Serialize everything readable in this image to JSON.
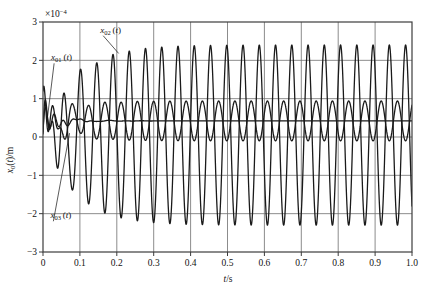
{
  "chart_data": {
    "type": "line",
    "title": "",
    "xlabel": "t/s",
    "ylabel": "x₀(t)/m",
    "y_multiplier": "×10⁻⁴",
    "y_multiplier_value": 0.0001,
    "xlim": [
      0,
      1.0
    ],
    "ylim": [
      -3,
      3
    ],
    "xticks": [
      "0",
      "0.1",
      "0.2",
      "0.3",
      "0.4",
      "0.5",
      "0.6",
      "0.7",
      "0.8",
      "0.9",
      "1.0"
    ],
    "xtick_values": [
      0,
      0.1,
      0.2,
      0.3,
      0.4,
      0.5,
      0.6,
      0.7,
      0.8,
      0.9,
      1.0
    ],
    "yticks": [
      "3",
      "2",
      "1",
      "0",
      "-1",
      "-2",
      "-3"
    ],
    "ytick_values": [
      3,
      2,
      1,
      0,
      -1,
      -2,
      -3
    ],
    "grid": true,
    "grid_x": true,
    "grid_y": true,
    "legend_position": "inline-annotations",
    "series": [
      {
        "name": "x01",
        "label": "x₀₁(t)",
        "label_base": "x",
        "label_sub": "01",
        "label_arg": "(t)",
        "color": "#1a1a1a",
        "line_width": 1.3,
        "description": "Heavily damped response settling to a steady offset of about 0.42e-4 m; early transient peaks near 0.85e-4 m and dips near -0.15e-4 m before flattening after ~0.15 s.",
        "steady_value": 0.42,
        "transient_peak": 0.85,
        "settle_time": 0.15
      },
      {
        "name": "x02",
        "label": "x₀₂(t)",
        "label_base": "x",
        "label_sub": "02",
        "label_arg": "(t)",
        "color": "#1a1a1a",
        "line_width": 1.3,
        "description": "Large-amplitude steady oscillation about a small positive mean; amplitude grows from the start and saturates near ±2.35e-4 m by t ≈ 0.25 s. Frequency about 22.7 Hz (period ≈ 0.044 s).",
        "steady_amplitude": 2.35,
        "mean_offset": 0.05,
        "frequency_hz": 22.7,
        "period_s": 0.044,
        "buildup_time": 0.25,
        "peak_max": 2.38,
        "peak_min": -2.45
      },
      {
        "name": "x03",
        "label": "x₀₃(t)",
        "label_base": "x",
        "label_sub": "03",
        "label_arg": "(t)",
        "color": "#1a1a1a",
        "line_width": 1.3,
        "description": "Medium-amplitude oscillation riding on the steady offset; settles to roughly ±0.52e-4 m about a mean of 0.42e-4 m. Same driving frequency region as x02 with an early transient to about 1.5e-4 m near t = 0.07 s.",
        "steady_amplitude": 0.52,
        "mean_offset": 0.42,
        "frequency_hz": 22.7,
        "transient_peak": 1.5,
        "transient_min": -1.2
      }
    ],
    "annotations": [
      {
        "name": "x02-annotation",
        "text": "x₀₂(t)",
        "label_base": "x",
        "label_sub": "02",
        "label_arg": "(t)",
        "text_x": 0.155,
        "text_y": 2.72,
        "target_x": 0.205,
        "target_y": 2.18
      },
      {
        "name": "x01-annotation",
        "text": "x₀₁(t)",
        "label_base": "x",
        "label_sub": "01",
        "label_arg": "(t)",
        "text_x": 0.022,
        "text_y": 2.0,
        "target_x": 0.012,
        "target_y": 0.5
      },
      {
        "name": "x03-annotation",
        "text": "x₀₃(t)",
        "label_base": "x",
        "label_sub": "03",
        "label_arg": "(t)",
        "text_x": 0.02,
        "text_y": -2.12,
        "target_x": 0.072,
        "target_y": 0.1
      }
    ]
  },
  "axes": {
    "x_axis_title": "t/s",
    "x_axis_title_var": "t",
    "x_axis_title_unit": "/s",
    "y_axis_title_var": "x",
    "y_axis_title_sub": "0",
    "y_axis_title_rest": "(t)/m",
    "multiplier": "×10",
    "multiplier_exp": "-4"
  },
  "colors": {
    "background": "#ffffff",
    "axis": "#3c3c3c",
    "grid": "#6e6e6e",
    "curve": "#1a1a1a",
    "text": "#121212"
  }
}
